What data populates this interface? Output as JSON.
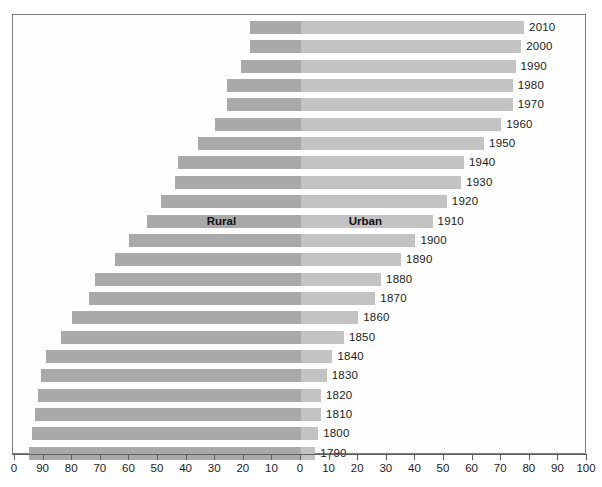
{
  "chart_data": {
    "type": "bar",
    "subtype": "diverging-stacked-bar",
    "title": "",
    "xlabel": "",
    "ylabel": "",
    "xlim": [
      -100,
      100
    ],
    "grid": false,
    "legend_position": "in-plot-on-1910-bar",
    "categories": [
      "2010",
      "2000",
      "1990",
      "1980",
      "1970",
      "1960",
      "1950",
      "1940",
      "1930",
      "1920",
      "1910",
      "1900",
      "1890",
      "1880",
      "1870",
      "1860",
      "1850",
      "1840",
      "1830",
      "1820",
      "1810",
      "1800",
      "1790"
    ],
    "series": [
      {
        "name": "Rural",
        "color": "#a9a9a9",
        "direction": "left",
        "values": [
          18,
          18,
          21,
          26,
          26,
          30,
          36,
          43,
          44,
          49,
          54,
          60,
          65,
          72,
          74,
          80,
          84,
          89,
          91,
          92,
          93,
          94,
          95
        ]
      },
      {
        "name": "Urban",
        "color": "#c3c3c3",
        "direction": "right",
        "values": [
          78,
          77,
          75,
          74,
          74,
          70,
          64,
          57,
          56,
          51,
          46,
          40,
          35,
          28,
          26,
          20,
          15,
          11,
          9,
          7,
          7,
          6,
          5
        ]
      }
    ],
    "x_ticks": [
      100,
      90,
      80,
      70,
      60,
      50,
      40,
      30,
      20,
      10,
      0,
      10,
      20,
      30,
      40,
      50,
      60,
      70,
      80,
      90,
      100
    ],
    "x_tick_labels": [
      "0",
      "90",
      "80",
      "70",
      "60",
      "50",
      "40",
      "30",
      "20",
      "10",
      "0",
      "10",
      "20",
      "30",
      "40",
      "50",
      "60",
      "70",
      "80",
      "90",
      "100"
    ],
    "in_plot_labels": [
      {
        "text": "Rural",
        "on_category": "1910",
        "side": "left"
      },
      {
        "text": "Urban",
        "on_category": "1910",
        "side": "right"
      }
    ],
    "year_labels": [
      "2010",
      "2000",
      "1990",
      "1980",
      "1970",
      "1960",
      "1950",
      "1940",
      "1930",
      "1920",
      "1910",
      "1900",
      "1890",
      "1880",
      "1870",
      "1860",
      "1850",
      "1840",
      "1830",
      "1820",
      "1810",
      "1800",
      "1790"
    ]
  },
  "colors": {
    "rural": "#a9a9a9",
    "urban": "#c3c3c3",
    "frame": "#7d7d7d",
    "axis": "#5f5f5f",
    "text": "#1b1b1b",
    "background": "#ffffff"
  }
}
